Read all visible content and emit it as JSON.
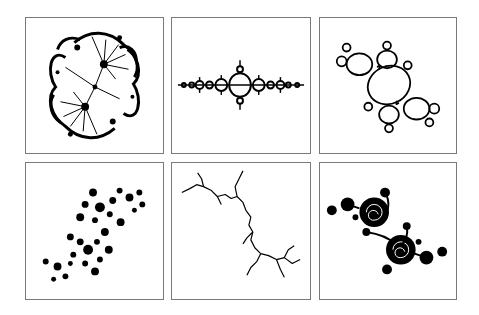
{
  "figure": {
    "layout": {
      "rows": 2,
      "columns": 3
    },
    "colors": {
      "background": "#ffffff",
      "frame": "#7a7a7a",
      "fractal": "#000000"
    },
    "panels": [
      {
        "id": "p1",
        "row": 1,
        "col": 1,
        "subject": "filled Julia set, dense S-shaped double lobe with radial fans",
        "style": "filled-dendritic"
      },
      {
        "id": "p2",
        "row": 1,
        "col": 2,
        "subject": "Julia set, horizontal chain of bulbs (basilica-like)",
        "style": "outline-horizontal"
      },
      {
        "id": "p3",
        "row": 1,
        "col": 3,
        "subject": "Julia set, diagonal outlined bulbs with two spiral centers (Douady rabbit-like)",
        "style": "outline-diagonal"
      },
      {
        "id": "p4",
        "row": 2,
        "col": 1,
        "subject": "Fatou dust, clusters of star-shaped blobs on a diagonal",
        "style": "dust"
      },
      {
        "id": "p5",
        "row": 2,
        "col": 2,
        "subject": "Dendrite Julia set, thin branching diagonal curve",
        "style": "dendrite"
      },
      {
        "id": "p6",
        "row": 2,
        "col": 3,
        "subject": "Julia set with two large black spirals on a diagonal",
        "style": "spiral-filled"
      }
    ]
  }
}
